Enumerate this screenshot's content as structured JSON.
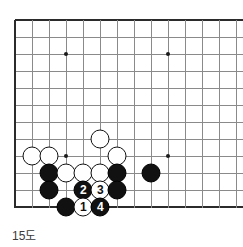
{
  "diagram": {
    "kind": "go-board-diagram",
    "caption": "15도",
    "board": {
      "origin_x": 15,
      "origin_y": 20,
      "spacing": 17,
      "cols": 14,
      "rows": 12,
      "left_edge_col": 0,
      "bottom_edge_row": 11,
      "line_color": "#8a8a8a",
      "edge_color": "#2b2b2b",
      "background": "#ffffff"
    },
    "star_points": [
      {
        "col": 3,
        "row": 2
      },
      {
        "col": 9,
        "row": 2
      },
      {
        "col": 3,
        "row": 8
      },
      {
        "col": 9,
        "row": 8
      }
    ],
    "stones": [
      {
        "col": 5,
        "row": 7,
        "color": "white",
        "label": ""
      },
      {
        "col": 1,
        "row": 8,
        "color": "white",
        "label": ""
      },
      {
        "col": 2,
        "row": 8,
        "color": "white",
        "label": ""
      },
      {
        "col": 6,
        "row": 8,
        "color": "white",
        "label": ""
      },
      {
        "col": 2,
        "row": 9,
        "color": "black",
        "label": ""
      },
      {
        "col": 3,
        "row": 9,
        "color": "white",
        "label": ""
      },
      {
        "col": 4,
        "row": 9,
        "color": "white",
        "label": ""
      },
      {
        "col": 5,
        "row": 9,
        "color": "white",
        "label": ""
      },
      {
        "col": 6,
        "row": 9,
        "color": "black",
        "label": ""
      },
      {
        "col": 8,
        "row": 9,
        "color": "black",
        "label": ""
      },
      {
        "col": 2,
        "row": 10,
        "color": "black",
        "label": ""
      },
      {
        "col": 4,
        "row": 10,
        "color": "black",
        "label": "2"
      },
      {
        "col": 5,
        "row": 10,
        "color": "white",
        "label": "3"
      },
      {
        "col": 6,
        "row": 10,
        "color": "black",
        "label": ""
      },
      {
        "col": 3,
        "row": 11,
        "color": "black",
        "label": ""
      },
      {
        "col": 4,
        "row": 11,
        "color": "white",
        "label": "1"
      },
      {
        "col": 5,
        "row": 11,
        "color": "black",
        "label": "4"
      }
    ]
  }
}
